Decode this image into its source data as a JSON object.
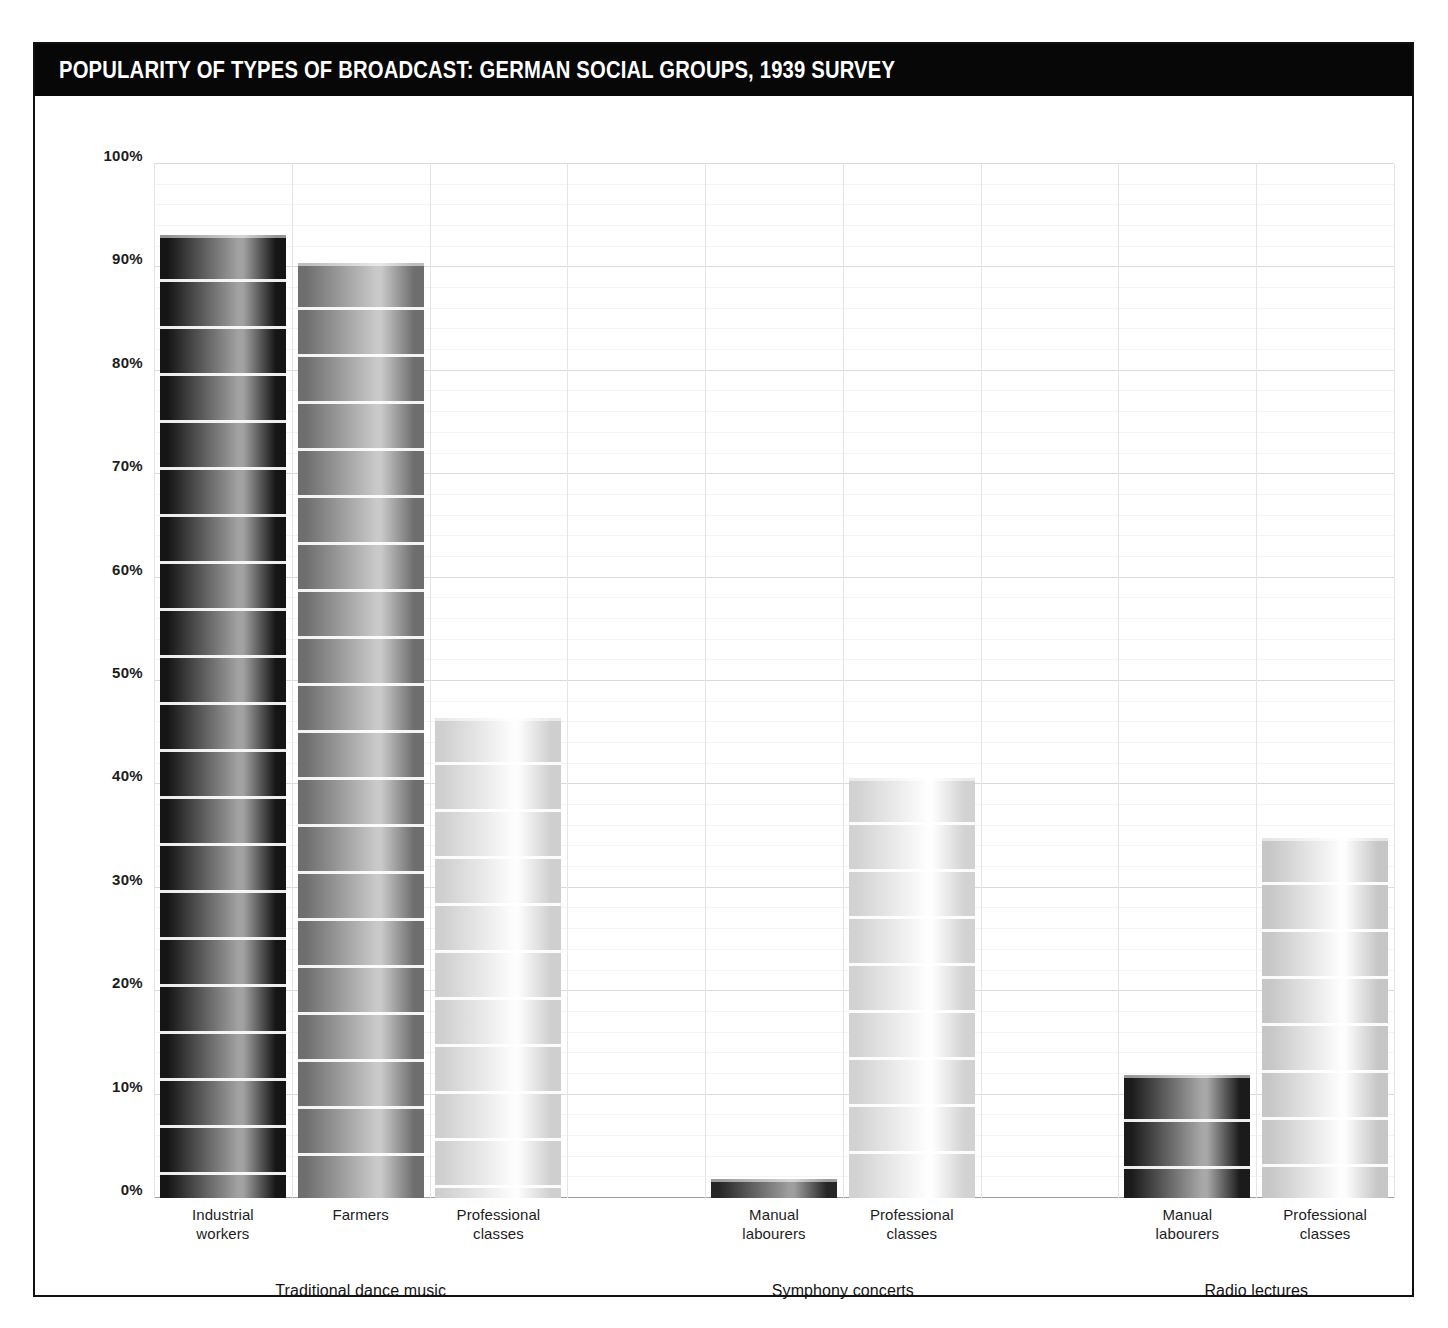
{
  "chart_data": {
    "type": "bar",
    "title": "POPULARITY OF TYPES OF BROADCAST: GERMAN SOCIAL GROUPS, 1939 SURVEY",
    "xlabel": "",
    "ylabel": "",
    "ylim": [
      0,
      100
    ],
    "y_tick_labels": [
      "0%",
      "10%",
      "20%",
      "30%",
      "40%",
      "50%",
      "60%",
      "70%",
      "80%",
      "90%",
      "100%"
    ],
    "y_tick_values": [
      0,
      10,
      20,
      30,
      40,
      50,
      60,
      70,
      80,
      90,
      100
    ],
    "grid": true,
    "legend": "none",
    "value_suffix": "%",
    "groups": [
      {
        "name": "Traditional dance music",
        "categories": [
          "Industrial workers",
          "Farmers",
          "Professional classes"
        ],
        "values": [
          93.1,
          90.4,
          46.4
        ],
        "value_labels": [
          "93.1%",
          "90.4%",
          "46.4%"
        ]
      },
      {
        "name": "Symphony concerts",
        "categories": [
          "Manual labourers",
          "Professional classes"
        ],
        "values": [
          1.8,
          40.6
        ],
        "value_labels": [
          "1.8%",
          "40.6%"
        ]
      },
      {
        "name": "Radio lectures",
        "categories": [
          "Manual labourers",
          "Professional classes"
        ],
        "values": [
          11.9,
          34.8
        ],
        "value_labels": [
          "11.9%",
          "34.8%"
        ]
      }
    ],
    "categories": [
      "Industrial workers",
      "Farmers",
      "Professional classes",
      "Manual labourers",
      "Professional classes",
      "Manual labourers",
      "Professional classes"
    ],
    "values": [
      93.1,
      90.4,
      46.4,
      1.8,
      40.6,
      11.9,
      34.8
    ]
  },
  "bars": [
    {
      "value_label": "93.1%",
      "line1": "Industrial",
      "line2": "workers",
      "slot": 0
    },
    {
      "value_label": "90.4%",
      "line1": "Farmers",
      "line2": "",
      "slot": 1
    },
    {
      "value_label": "46.4%",
      "line1": "Professional",
      "line2": "classes",
      "slot": 2
    },
    {
      "value_label": "1.8%",
      "line1": "Manual",
      "line2": "labourers",
      "slot": 4
    },
    {
      "value_label": "40.6%",
      "line1": "Professional",
      "line2": "classes",
      "slot": 5
    },
    {
      "value_label": "11.9%",
      "line1": "Manual",
      "line2": "labourers",
      "slot": 7
    },
    {
      "value_label": "34.8%",
      "line1": "Professional",
      "line2": "classes",
      "slot": 8
    }
  ],
  "group_labels": [
    {
      "text": "Traditional dance music"
    },
    {
      "text": "Symphony concerts"
    },
    {
      "text": "Radio lectures"
    }
  ],
  "colors": {
    "title_bar": "#070707",
    "title_text": "#ffffff",
    "frame_border": "#111111",
    "background": "#ffffff",
    "gridline_major": "#d8dce0",
    "gridline_minor": "#f2f4f6",
    "axis_line": "#9aa0a6",
    "label_text": "#1c1c1c",
    "bar_dark": "#1a1a1a",
    "bar_mid": "#8d8d8d",
    "bar_light": "#e8e8e8"
  }
}
